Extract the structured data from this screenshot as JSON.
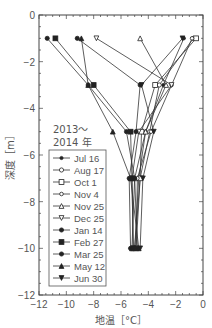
{
  "chart_data": {
    "type": "line",
    "title": "",
    "xlabel": "地温［°C］",
    "ylabel": "深度［m］",
    "xlim": [
      -12,
      0
    ],
    "ylim": [
      -12,
      0
    ],
    "x_ticks": [
      "-12",
      "-10",
      "-8",
      "-6",
      "-4",
      "-2",
      "0"
    ],
    "y_ticks": [
      "0",
      "-2",
      "-4",
      "-6",
      "-8",
      "-10",
      "-12"
    ],
    "grid": false,
    "legend_title": "2013～\n2014 年",
    "legend_title_lines": [
      "2013～",
      "2014 年"
    ],
    "legend_position": "lower left",
    "depths": [
      -1,
      -3,
      -5,
      -7,
      -10
    ],
    "series": [
      {
        "name": "Jul 16",
        "marker": "star",
        "temps": [
          -1.4,
          -2.9,
          -4.2,
          -4.7,
          -5.0
        ]
      },
      {
        "name": "Aug 17",
        "marker": "open-circle",
        "temps": [
          -0.7,
          -3.2,
          -3.9,
          -4.6,
          -5.0
        ]
      },
      {
        "name": "Oct 1",
        "marker": "open-square",
        "temps": [
          -0.5,
          -3.5,
          -4.5,
          -4.6,
          -4.9
        ]
      },
      {
        "name": "Nov 4",
        "marker": "open-circle-small",
        "temps": [
          -0.8,
          -2.3,
          -3.8,
          -4.8,
          -4.9
        ]
      },
      {
        "name": "Nov 25",
        "marker": "open-triangle",
        "temps": [
          -4.6,
          -2.7,
          -4.2,
          -5.0,
          -5.2
        ]
      },
      {
        "name": "Dec 25",
        "marker": "open-down-triangle",
        "temps": [
          -7.8,
          -2.3,
          -4.7,
          -5.2,
          -5.1
        ]
      },
      {
        "name": "Jan 14",
        "marker": "filled-circle",
        "temps": [
          -9.2,
          -4.6,
          -4.9,
          -5.4,
          -5.3
        ]
      },
      {
        "name": "Feb 27",
        "marker": "filled-square",
        "temps": [
          -10.8,
          -8.0,
          -5.3,
          -5.2,
          -5.1
        ]
      },
      {
        "name": "Mar 25",
        "marker": "filled-circle",
        "temps": [
          -11.4,
          -8.4,
          -5.6,
          -5.0,
          -4.8
        ]
      },
      {
        "name": "May 12",
        "marker": "filled-triangle",
        "temps": [
          -8.9,
          -8.4,
          -6.6,
          -5.3,
          -4.7
        ]
      },
      {
        "name": "Jun 30",
        "marker": "filled-down-triangle",
        "temps": [
          -1.5,
          -4.5,
          -3.6,
          -4.4,
          -4.6
        ]
      }
    ]
  }
}
